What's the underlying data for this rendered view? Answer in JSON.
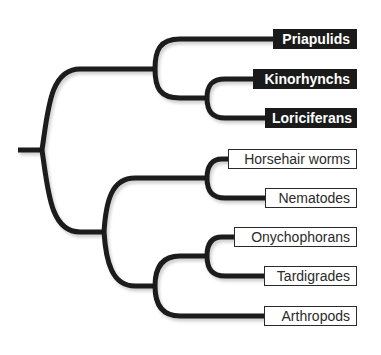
{
  "diagram": {
    "type": "phylogenetic-tree",
    "branch_color": "#1a1a1a",
    "taxa": [
      {
        "label": "Priapulids",
        "style": "dark",
        "box": [
          273,
          29,
          84
        ]
      },
      {
        "label": "Kinorhynchs",
        "style": "dark",
        "box": [
          253,
          69,
          104
        ]
      },
      {
        "label": "Loriciferans",
        "style": "dark",
        "box": [
          265,
          108,
          92
        ]
      },
      {
        "label": "Horsehair worms",
        "style": "light",
        "box": [
          228,
          149,
          129
        ]
      },
      {
        "label": "Nematodes",
        "style": "light",
        "box": [
          265,
          188,
          92
        ]
      },
      {
        "label": "Onychophorans",
        "style": "light",
        "box": [
          234,
          227,
          123
        ]
      },
      {
        "label": "Tardigrades",
        "style": "light",
        "box": [
          264,
          266,
          93
        ]
      },
      {
        "label": "Arthropods",
        "style": "light",
        "box": [
          264,
          306,
          93
        ]
      }
    ],
    "clades": [
      {
        "name": "Priapulids+Kinorhynchs+Loriciferans",
        "style": "dark"
      },
      {
        "name": "Horsehair worms+Nematodes+Onychophorans+Tardigrades+Arthropods",
        "style": "light"
      }
    ]
  }
}
